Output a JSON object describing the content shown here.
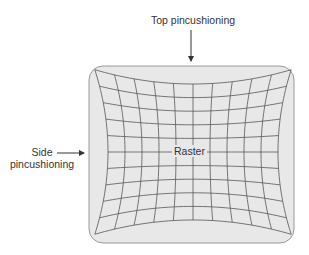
{
  "labels": {
    "top": "Top pincushioning",
    "side_line1": "Side",
    "side_line2": "pincushioning",
    "raster": "Raster"
  },
  "colors": {
    "screen_fill": "#e8e8e8",
    "screen_border": "#9a9a9a",
    "grid_line": "#555555",
    "arrow": "#333333",
    "text": "#333333"
  },
  "screen": {
    "x": 89,
    "y": 66,
    "width": 205,
    "height": 177,
    "corner_radius": 14
  },
  "grid": {
    "center_x": 193,
    "center_y": 152,
    "half_width": 85,
    "half_height": 68,
    "columns": 10,
    "rows": 10,
    "horizontal_bulge": 0.155,
    "vertical_bulge": 0.21
  },
  "arrows": {
    "top": {
      "x": 191,
      "y1": 30,
      "y2": 65
    },
    "side": {
      "y": 153,
      "x1": 57,
      "x2": 88
    }
  }
}
